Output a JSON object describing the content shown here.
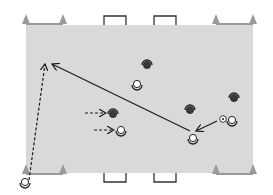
{
  "diagram": {
    "type": "soccer-drill",
    "colors": {
      "background": "#ffffff",
      "pitch": "#d9d9d9",
      "cone": "#9a9a9a",
      "goal": "#333333",
      "line": "#1a1a1a",
      "opponent": "#3a3a3a",
      "teammate": "#ffffff"
    },
    "pitch": {
      "x": 26,
      "y": 25,
      "width": 227,
      "height": 148
    },
    "cone_gates": [
      {
        "name": "top-left",
        "x1": 26,
        "x2": 63,
        "y": 24,
        "dir": "up"
      },
      {
        "name": "top-right",
        "x1": 216,
        "x2": 253,
        "y": 24,
        "dir": "up"
      },
      {
        "name": "bottom-left",
        "x1": 26,
        "x2": 63,
        "y": 174,
        "dir": "up"
      },
      {
        "name": "bottom-right",
        "x1": 216,
        "x2": 253,
        "y": 174,
        "dir": "up"
      }
    ],
    "goals": [
      {
        "name": "top-goal-1",
        "x": 104,
        "y": 16,
        "w": 22,
        "h": 9,
        "side": "top"
      },
      {
        "name": "top-goal-2",
        "x": 154,
        "y": 16,
        "w": 22,
        "h": 9,
        "side": "top"
      },
      {
        "name": "bottom-goal-1",
        "x": 104,
        "y": 173,
        "w": 22,
        "h": 9,
        "side": "bottom"
      },
      {
        "name": "bottom-goal-2",
        "x": 154,
        "y": 173,
        "w": 22,
        "h": 9,
        "side": "bottom"
      }
    ],
    "opponents": [
      {
        "x": 147,
        "y": 64
      },
      {
        "x": 190,
        "y": 109
      },
      {
        "x": 234,
        "y": 97
      },
      {
        "x": 113,
        "y": 113
      }
    ],
    "teammates": [
      {
        "x": 137,
        "y": 84
      },
      {
        "x": 193,
        "y": 138
      },
      {
        "x": 232,
        "y": 120
      },
      {
        "x": 121,
        "y": 130
      },
      {
        "x": 25,
        "y": 182
      }
    ],
    "ball": {
      "x": 223,
      "y": 119
    },
    "passes": [
      {
        "name": "long-pass",
        "x1": 190,
        "y1": 131,
        "x2": 52,
        "y2": 64,
        "style": "solid"
      },
      {
        "name": "short-pass",
        "x1": 217,
        "y1": 121,
        "x2": 196,
        "y2": 131,
        "style": "solid"
      }
    ],
    "runs": [
      {
        "name": "overlap-run",
        "x1": 29,
        "y1": 180,
        "x2": 45,
        "y2": 64,
        "style": "dashed"
      },
      {
        "name": "run-opponent",
        "x1": 85,
        "y1": 113,
        "x2": 106,
        "y2": 113,
        "style": "dashed"
      },
      {
        "name": "run-teammate",
        "x1": 94,
        "y1": 130,
        "x2": 114,
        "y2": 130,
        "style": "dashed"
      }
    ]
  }
}
